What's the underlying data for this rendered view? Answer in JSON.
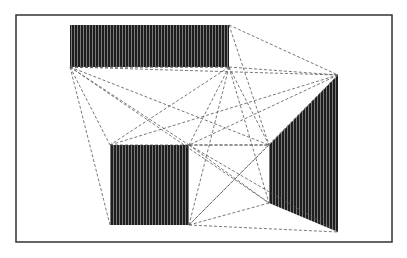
{
  "figure": {
    "width": 407,
    "height": 258,
    "background": "#ffffff",
    "frame": {
      "x": 16,
      "y": 15,
      "w": 376,
      "h": 227,
      "stroke": "#333333"
    },
    "fill_color": "#1e1e1e",
    "hatch_color": "#9a9a9a",
    "line_color": "#555555",
    "shapes": [
      {
        "name": "top-rectangle",
        "points": [
          [
            70,
            25
          ],
          [
            229,
            25
          ],
          [
            229,
            67
          ],
          [
            70,
            67
          ]
        ]
      },
      {
        "name": "bottom-square",
        "points": [
          [
            110,
            145
          ],
          [
            189,
            145
          ],
          [
            189,
            225
          ],
          [
            110,
            225
          ]
        ]
      },
      {
        "name": "right-quadrilateral",
        "points": [
          [
            269,
            145
          ],
          [
            338,
            75
          ],
          [
            338,
            232
          ],
          [
            269,
            203
          ]
        ]
      }
    ],
    "dashed_lines": [
      [
        [
          229,
          25
        ],
        [
          338,
          75
        ]
      ],
      [
        [
          229,
          25
        ],
        [
          269,
          145
        ]
      ],
      [
        [
          70,
          67
        ],
        [
          338,
          75
        ]
      ],
      [
        [
          70,
          67
        ],
        [
          229,
          67
        ]
      ],
      [
        [
          70,
          67
        ],
        [
          110,
          145
        ]
      ],
      [
        [
          70,
          67
        ],
        [
          110,
          225
        ]
      ],
      [
        [
          70,
          67
        ],
        [
          189,
          145
        ]
      ],
      [
        [
          70,
          67
        ],
        [
          269,
          145
        ]
      ],
      [
        [
          70,
          67
        ],
        [
          269,
          203
        ]
      ],
      [
        [
          229,
          67
        ],
        [
          338,
          75
        ]
      ],
      [
        [
          229,
          67
        ],
        [
          110,
          145
        ]
      ],
      [
        [
          229,
          67
        ],
        [
          189,
          145
        ]
      ],
      [
        [
          229,
          67
        ],
        [
          189,
          225
        ]
      ],
      [
        [
          229,
          67
        ],
        [
          269,
          145
        ]
      ],
      [
        [
          229,
          67
        ],
        [
          269,
          203
        ]
      ],
      [
        [
          338,
          75
        ],
        [
          110,
          145
        ]
      ],
      [
        [
          338,
          75
        ],
        [
          189,
          145
        ]
      ],
      [
        [
          338,
          75
        ],
        [
          189,
          225
        ]
      ],
      [
        [
          110,
          145
        ],
        [
          269,
          145
        ]
      ],
      [
        [
          189,
          145
        ],
        [
          269,
          145
        ]
      ],
      [
        [
          189,
          145
        ],
        [
          269,
          203
        ]
      ],
      [
        [
          189,
          145
        ],
        [
          338,
          232
        ]
      ],
      [
        [
          269,
          145
        ],
        [
          189,
          225
        ]
      ],
      [
        [
          189,
          225
        ],
        [
          269,
          203
        ]
      ],
      [
        [
          189,
          225
        ],
        [
          338,
          232
        ]
      ],
      [
        [
          70,
          67
        ],
        [
          229,
          67
        ]
      ]
    ]
  }
}
